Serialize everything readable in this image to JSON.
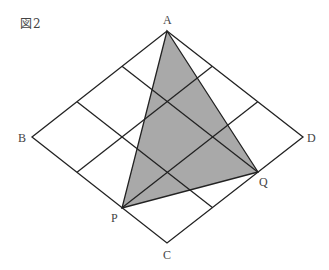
{
  "figure": {
    "title": "図2"
  },
  "diagram": {
    "type": "rhombus-grid-with-triangle",
    "grid_divisions": 3,
    "colors": {
      "line": "#222222",
      "fill": "#a9a9a9",
      "label": "#444444"
    },
    "vertices": {
      "A": {
        "label": "A",
        "x": 167,
        "y": 31
      },
      "B": {
        "label": "B",
        "x": 32,
        "y": 137
      },
      "C": {
        "label": "C",
        "x": 167,
        "y": 243
      },
      "D": {
        "label": "D",
        "x": 303,
        "y": 137
      },
      "P": {
        "label": "P",
        "x": 122,
        "y": 208
      },
      "Q": {
        "label": "Q",
        "x": 258,
        "y": 172
      }
    },
    "shaded_triangle": [
      "A",
      "P",
      "Q"
    ]
  }
}
